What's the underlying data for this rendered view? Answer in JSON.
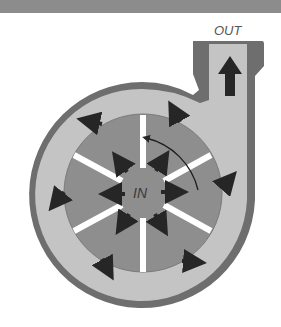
{
  "diagram": {
    "labels": {
      "outlet": "OUT",
      "inlet": "IN"
    },
    "colors": {
      "banner": "#8c8c8c",
      "casing_wall": "#6e6e6e",
      "volute_fluid": "#c4c4c4",
      "impeller": "#8e8e8e",
      "vanes": "#ffffff",
      "arrows": "#262626",
      "rotation_arrow": "#1e1e1e"
    },
    "impeller": {
      "vane_count": 8,
      "rotation": "counter-clockwise"
    },
    "flow_arrows": {
      "inner_count": 8,
      "outer_count": 8,
      "outlet_count": 1
    }
  }
}
